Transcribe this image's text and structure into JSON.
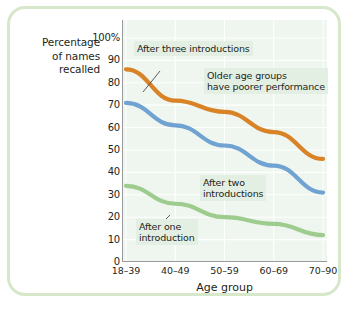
{
  "chart_data": {
    "type": "line",
    "title": "",
    "subtitle": "",
    "xlabel": "Age group",
    "ylabel": "Percentage of names recalled",
    "categories": [
      "18–39",
      "40–49",
      "50–59",
      "60–69",
      "70–90"
    ],
    "ylim": [
      0,
      108
    ],
    "xlim": [
      0,
      4
    ],
    "ytick_labels": [
      "0",
      "10",
      "20",
      "30",
      "40",
      "50",
      "60",
      "70",
      "80",
      "90",
      "100%"
    ],
    "ytick_values": [
      0,
      10,
      20,
      30,
      40,
      50,
      60,
      70,
      80,
      90,
      100
    ],
    "grid": "horizontal-and-vertical white gridlines on tinted panel",
    "legend": "none (inline annotations)",
    "series": [
      {
        "name": "After three introductions",
        "color": "#d98326",
        "values": [
          86,
          72,
          67,
          58,
          46
        ]
      },
      {
        "name": "After two introductions",
        "color": "#71a3d2",
        "values": [
          71,
          61,
          52,
          43,
          31
        ]
      },
      {
        "name": "After one introduction",
        "color": "#9ecb8e",
        "values": [
          34,
          26,
          20,
          17,
          12
        ]
      }
    ],
    "annotations": [
      {
        "id": "after-three-introductions",
        "text": "After three introductions",
        "points_to": "orange-line"
      },
      {
        "id": "older-age-groups",
        "text": "Older age groups\nhave poorer performance",
        "points_to": ""
      },
      {
        "id": "after-two-introductions",
        "text": "After two\nintroductions",
        "points_to": "blue-line"
      },
      {
        "id": "after-one-introduction",
        "text": "After one\nintroduction",
        "points_to": "green-line"
      }
    ]
  },
  "figure": {
    "y_axis_title_line1": "Percentage",
    "y_axis_title_line2": "of names",
    "y_axis_title_line3": "recalled",
    "x_axis_title": "Age group",
    "border_color": "#d6e8c9",
    "panel_color": "#eef6ef",
    "gridline_color": "#ffffff",
    "annotation_bg": "#e4efe4",
    "axis_color": "#9a9a9a"
  }
}
